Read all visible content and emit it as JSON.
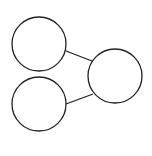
{
  "diagram": {
    "background": "#ffffff",
    "stroke_color": "#222222",
    "stroke_width": 1.3,
    "nodes": [
      {
        "id": "top-left",
        "cx": 39,
        "cy": 44,
        "r": 27,
        "label": ""
      },
      {
        "id": "bottom-left",
        "cx": 39,
        "cy": 104,
        "r": 27,
        "label": ""
      },
      {
        "id": "right",
        "cx": 115,
        "cy": 76,
        "r": 27,
        "label": ""
      }
    ],
    "edges": [
      {
        "from": "top-left",
        "to": "right",
        "x1": 66,
        "y1": 51,
        "x2": 92,
        "y2": 61
      },
      {
        "from": "bottom-left",
        "to": "right",
        "x1": 66,
        "y1": 104,
        "x2": 93,
        "y2": 94
      }
    ]
  }
}
